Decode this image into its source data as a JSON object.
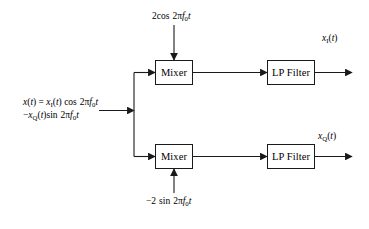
{
  "diagram": {
    "background": "#ffffff",
    "line_color": "#1a1a1a",
    "blocks": {
      "mixer_top": "Mixer",
      "mixer_bottom": "Mixer",
      "lpf_top": "LP Filter",
      "lpf_bottom": "LP Filter"
    },
    "labels": {
      "oscillator_top": "2cos 2πf₀t",
      "oscillator_bottom": "−2 sin 2πf₀t",
      "output_inphase": "xᵢ(t)",
      "output_quadrature": "x_Q(t)",
      "input_line1": "x(t) = x₁(t) cos 2πf₀t",
      "input_line2": "−x_Q(t)sin 2πf₀t"
    }
  }
}
